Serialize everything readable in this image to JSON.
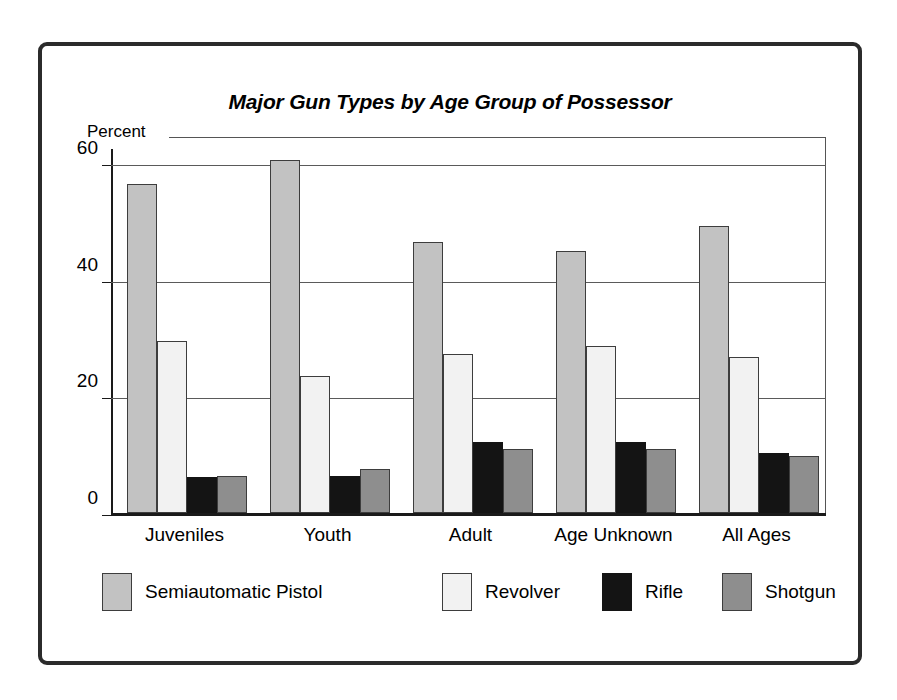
{
  "chart_data": {
    "type": "bar",
    "title": "Major Gun Types by Age Group of Possessor",
    "xlabel": "",
    "ylabel": "Percent",
    "ylim": [
      0,
      65
    ],
    "yticks": [
      0,
      20,
      40,
      60
    ],
    "ytick_labels": [
      "0",
      "20",
      "40",
      "60"
    ],
    "grid": true,
    "legend_position": "bottom",
    "categories": [
      "Juveniles",
      "Youth",
      "Adult",
      "Age Unknown",
      "All Ages"
    ],
    "series": [
      {
        "name": "Semiautomatic Pistol",
        "color": "#c2c2c2",
        "values": [
          56.5,
          60.5,
          46.4,
          44.9,
          49.2
        ]
      },
      {
        "name": "Revolver",
        "color": "#f2f2f2",
        "values": [
          29.5,
          23.5,
          27.2,
          28.7,
          26.8
        ]
      },
      {
        "name": "Rifle",
        "color": "#141414",
        "values": [
          6.2,
          6.4,
          12.1,
          12.1,
          10.3
        ]
      },
      {
        "name": "Shotgun",
        "color": "#8e8e8e",
        "values": [
          6.4,
          7.6,
          11.0,
          11.0,
          9.7
        ]
      }
    ]
  },
  "legend": {
    "items": [
      {
        "label": "Semiautomatic Pistol",
        "color": "#c2c2c2"
      },
      {
        "label": "Revolver",
        "color": "#f2f2f2"
      },
      {
        "label": "Rifle",
        "color": "#141414"
      },
      {
        "label": "Shotgun",
        "color": "#8e8e8e"
      }
    ]
  }
}
